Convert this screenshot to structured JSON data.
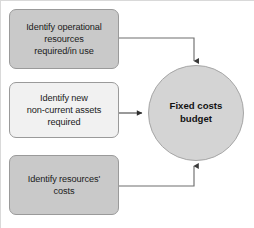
{
  "diagram": {
    "canvas": {
      "width": 254,
      "height": 228,
      "background": "#ffffff"
    },
    "nodes": [
      {
        "id": "operational-resources",
        "label": "Identify operational resources required/in use",
        "lines": [
          "Identify operational",
          "resources",
          "required/in use"
        ],
        "shape": "rounded-rect",
        "fill": "#c9c9c9",
        "stroke": "#9a9a9a"
      },
      {
        "id": "new-noncurrent-assets",
        "label": "Identify new non-current assets required",
        "lines": [
          "Identify new",
          "non-current assets",
          "required"
        ],
        "shape": "rounded-rect",
        "fill": "#f1f1f1",
        "stroke": "#9a9a9a"
      },
      {
        "id": "resources-costs",
        "label": "Identify resources' costs",
        "lines": [
          "Identify resources'",
          "costs"
        ],
        "shape": "rounded-rect",
        "fill": "#c9c9c9",
        "stroke": "#9a9a9a"
      },
      {
        "id": "fixed-costs-budget",
        "label": "Fixed costs budget",
        "lines": [
          "Fixed costs",
          "budget"
        ],
        "shape": "circle",
        "fill": "#d4d4d4",
        "stroke": "#a6a6a6",
        "bold": true
      }
    ],
    "connectors": [
      {
        "id": "operational-to-budget",
        "from": "operational-resources",
        "to": "fixed-costs-budget",
        "route": "right-then-down",
        "arrowhead": "filled-triangle",
        "color": "#6f6f6f"
      },
      {
        "id": "assets-to-budget",
        "from": "new-noncurrent-assets",
        "to": "fixed-costs-budget",
        "route": "straight-right",
        "arrowhead": "filled-triangle",
        "color": "#4d4d4d"
      },
      {
        "id": "costs-to-budget",
        "from": "resources-costs",
        "to": "fixed-costs-budget",
        "route": "right-then-up",
        "arrowhead": "filled-triangle",
        "color": "#6f6f6f"
      }
    ]
  }
}
